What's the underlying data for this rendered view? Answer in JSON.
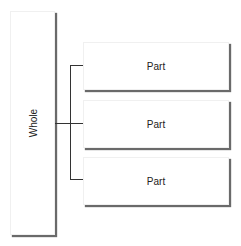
{
  "diagram": {
    "type": "hierarchy",
    "root": {
      "label": "Whole"
    },
    "children": [
      {
        "label": "Part"
      },
      {
        "label": "Part"
      },
      {
        "label": "Part"
      }
    ],
    "colors": {
      "line": "#333333",
      "shadow": "#6a6a6a",
      "box_fill": "#ffffff",
      "text": "#222222"
    }
  }
}
